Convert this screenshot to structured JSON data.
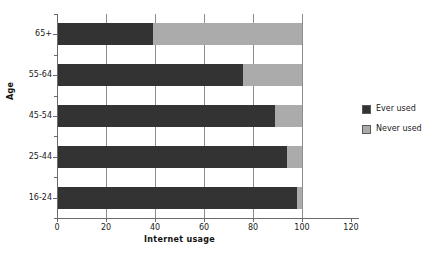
{
  "chart_data": {
    "type": "bar",
    "orientation": "horizontal",
    "stacked": true,
    "title": "",
    "xlabel": "Internet usage",
    "ylabel": "Age",
    "categories": [
      "16-24",
      "25-44",
      "45-54",
      "55-64",
      "65+"
    ],
    "series": [
      {
        "name": "Ever used",
        "color": "#333333",
        "values": [
          98,
          94,
          89,
          76,
          39
        ]
      },
      {
        "name": "Never used",
        "color": "#ababab",
        "values": [
          2,
          6,
          11,
          24,
          61
        ]
      }
    ],
    "xlim": [
      0,
      120
    ],
    "xticks": [
      0,
      20,
      40,
      60,
      80,
      100,
      120
    ],
    "xtick_labels": [
      "0",
      "20",
      "40",
      "60",
      "80",
      "100",
      "120"
    ],
    "grid": "vertical",
    "legend_position": "right"
  },
  "legend": {
    "entries": [
      {
        "label": "Ever used",
        "swatch": "ever-used-swatch"
      },
      {
        "label": "Never used",
        "swatch": "never-used-swatch"
      }
    ]
  },
  "axes": {
    "x_title": "Internet usage",
    "y_title": "Age"
  }
}
